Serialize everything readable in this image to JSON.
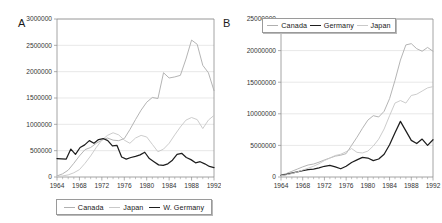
{
  "figure": {
    "panels": [
      {
        "label": "A",
        "legend_position": "below-plot"
      },
      {
        "label": "B",
        "legend_position": "inside-top"
      }
    ]
  },
  "colors": {
    "canada": "#b0b0b0",
    "japan": "#c9c9c9",
    "germany": "#1e1e1e",
    "grid": "#d8d8d8",
    "axis": "#8d8d8d",
    "text": "#353535"
  },
  "chart_data": [
    {
      "type": "line",
      "panel_label": "A",
      "title": "",
      "xlabel": "",
      "ylabel": "",
      "xlim": [
        1964,
        1992
      ],
      "ylim": [
        0,
        3000000
      ],
      "grid": true,
      "legend_position": "bottom",
      "xticks": [
        1964,
        1968,
        1972,
        1976,
        1980,
        1984,
        1988,
        1992
      ],
      "xtick_labels": [
        "1964",
        "1968",
        "1972",
        "1976",
        "1980",
        "1984",
        "1988",
        "1992"
      ],
      "yticks": [
        0,
        500000,
        1000000,
        1500000,
        2000000,
        2500000,
        3000000
      ],
      "ytick_labels": [
        "0",
        "500000",
        "1000000",
        "1500000",
        "2000000",
        "2500000",
        "3000000"
      ],
      "x": [
        1964,
        1965,
        1966,
        1967,
        1968,
        1969,
        1970,
        1971,
        1972,
        1973,
        1974,
        1975,
        1976,
        1977,
        1978,
        1979,
        1980,
        1981,
        1982,
        1983,
        1984,
        1985,
        1986,
        1987,
        1988,
        1989,
        1990,
        1991,
        1992
      ],
      "series": [
        {
          "name": "Canada",
          "color": "#b0b0b0",
          "values": [
            20000,
            60000,
            130000,
            260000,
            400000,
            520000,
            560000,
            640000,
            700000,
            740000,
            700000,
            690000,
            730000,
            900000,
            1090000,
            1270000,
            1420000,
            1510000,
            1490000,
            1980000,
            1880000,
            1900000,
            1930000,
            2240000,
            2600000,
            2520000,
            2120000,
            1980000,
            1640000
          ]
        },
        {
          "name": "Japan",
          "color": "#c9c9c9",
          "values": [
            10000,
            20000,
            40000,
            80000,
            140000,
            260000,
            400000,
            560000,
            700000,
            790000,
            840000,
            800000,
            700000,
            640000,
            740000,
            790000,
            760000,
            620000,
            480000,
            530000,
            640000,
            800000,
            950000,
            1080000,
            1130000,
            1090000,
            920000,
            1080000,
            1170000
          ]
        },
        {
          "name": "W. Germany",
          "color": "#1e1e1e",
          "values": [
            350000,
            345000,
            340000,
            530000,
            430000,
            560000,
            610000,
            690000,
            640000,
            710000,
            730000,
            690000,
            590000,
            600000,
            380000,
            340000,
            370000,
            390000,
            420000,
            470000,
            350000,
            290000,
            230000,
            220000,
            250000,
            320000,
            430000,
            450000,
            370000,
            330000,
            270000,
            290000,
            250000,
            200000,
            180000
          ]
        }
      ]
    },
    {
      "type": "line",
      "panel_label": "B",
      "title": "",
      "xlabel": "",
      "ylabel": "",
      "xlim": [
        1964,
        1992
      ],
      "ylim": [
        0,
        25000000
      ],
      "grid": true,
      "legend_position": "top",
      "xticks": [
        1964,
        1968,
        1972,
        1976,
        1980,
        1984,
        1988,
        1992
      ],
      "xtick_labels": [
        "1964",
        "1968",
        "1972",
        "1976",
        "1980",
        "1984",
        "1988",
        "1992"
      ],
      "yticks": [
        0,
        5000000,
        10000000,
        15000000,
        20000000,
        25000000
      ],
      "ytick_labels": [
        "0",
        "5000000",
        "10000000",
        "15000000",
        "20000000",
        "25000000"
      ],
      "x": [
        1964,
        1965,
        1966,
        1967,
        1968,
        1969,
        1970,
        1971,
        1972,
        1973,
        1974,
        1975,
        1976,
        1977,
        1978,
        1979,
        1980,
        1981,
        1982,
        1983,
        1984,
        1985,
        1986,
        1987,
        1988,
        1989,
        1990,
        1991,
        1992
      ],
      "series": [
        {
          "name": "Canada",
          "color": "#b0b0b0",
          "values": [
            300000,
            550000,
            900000,
            1250000,
            1600000,
            1900000,
            2050000,
            2350000,
            2700000,
            3000000,
            3300000,
            3450000,
            3700000,
            5000000,
            6300000,
            7700000,
            9000000,
            9700000,
            9500000,
            10400000,
            12400000,
            15300000,
            18500000,
            20900000,
            21100000,
            20300000,
            19900000,
            20500000,
            19900000
          ]
        },
        {
          "name": "Germany",
          "color": "#1e1e1e",
          "values": [
            250000,
            400000,
            600000,
            800000,
            1000000,
            1150000,
            1250000,
            1450000,
            1700000,
            1850000,
            1600000,
            1300000,
            1700000,
            2300000,
            2700000,
            3100000,
            3000000,
            2600000,
            2850000,
            3600000,
            5100000,
            7000000,
            8800000,
            7300000,
            5800000,
            5300000,
            6000000,
            5000000,
            5900000
          ]
        },
        {
          "name": "Japan",
          "color": "#c9c9c9",
          "values": [
            200000,
            350000,
            550000,
            800000,
            1100000,
            1400000,
            1700000,
            2100000,
            2600000,
            3000000,
            3400000,
            3600000,
            4000000,
            4500000,
            3900000,
            3800000,
            4100000,
            4900000,
            6000000,
            7600000,
            9700000,
            11700000,
            12100000,
            11700000,
            12900000,
            13100000,
            13600000,
            14100000,
            14300000
          ]
        }
      ]
    }
  ]
}
